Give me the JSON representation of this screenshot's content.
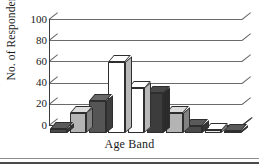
{
  "chart_data": {
    "type": "bar",
    "title": "",
    "xlabel": "Age Band",
    "ylabel": "No. of Respondents",
    "ylim": [
      0,
      100
    ],
    "yticks": [
      0,
      20,
      40,
      60,
      80,
      100
    ],
    "grid": true,
    "legend": "none",
    "style": "3d-column",
    "categories": [
      "1",
      "2",
      "3",
      "4",
      "5",
      "6",
      "7",
      "8",
      "9",
      "10"
    ],
    "values": [
      4,
      19,
      30,
      67,
      42,
      38,
      19,
      7,
      3,
      1
    ],
    "bar_colors": [
      "#4a4a4a",
      "#b4b4b4",
      "#555555",
      "#ffffff",
      "#ffffff",
      "#3c3c3c",
      "#b4b4b4",
      "#4a4a4a",
      "#e8e8e8",
      "#4a4a4a"
    ],
    "series": [
      {
        "name": "No. of Respondents",
        "values": [
          4,
          19,
          30,
          67,
          42,
          38,
          19,
          7,
          3,
          1
        ]
      }
    ]
  },
  "axis": {
    "y_title": "No. of Respondents",
    "x_title": "Age Band",
    "tick_labels": [
      "100",
      "80",
      "60",
      "40",
      "20",
      "0"
    ]
  },
  "colors": {
    "axis": "#3a3a3a",
    "grid": "#6b6b6b",
    "bar_dark": "#4a4a4a",
    "bar_light": "#b4b4b4",
    "bar_white": "#ffffff",
    "background": "#ffffff"
  }
}
